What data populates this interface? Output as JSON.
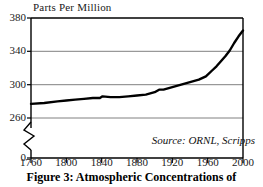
{
  "figure": {
    "caption": "Figure 3: Atmospheric Concentrations of",
    "source_note": "Source: ORNL, Scripps",
    "axis_title": "Parts Per Million"
  },
  "colors": {
    "line": "#000000",
    "grid": "#808080",
    "frame": "#000000",
    "text": "#1a1a1a",
    "background": "#ffffff"
  },
  "chart_data": {
    "type": "line",
    "title": "Parts Per Million",
    "xlabel": "",
    "ylabel": "Parts Per Million",
    "xlim": [
      1760,
      2000
    ],
    "ylim": [
      260,
      380
    ],
    "y_axis_break": true,
    "y_break_labels": [
      "0",
      "260"
    ],
    "grid": true,
    "legend": "none",
    "annotations": [
      "Source: ORNL, Scripps"
    ],
    "xticks": [
      1760,
      1800,
      1840,
      1880,
      1920,
      1960,
      2000
    ],
    "yticks": [
      0,
      260,
      300,
      340,
      380
    ],
    "series": [
      {
        "name": "Atmospheric CO2 concentration",
        "x": [
          1760,
          1775,
          1790,
          1800,
          1810,
          1820,
          1830,
          1838,
          1841,
          1850,
          1860,
          1870,
          1880,
          1890,
          1900,
          1905,
          1910,
          1920,
          1930,
          1940,
          1950,
          1958,
          1965,
          1970,
          1975,
          1980,
          1985,
          1990,
          1995,
          2000
        ],
        "values": [
          277,
          278,
          280,
          281,
          282,
          283,
          284,
          284,
          286,
          285,
          285,
          286,
          287,
          288,
          291,
          294,
          294,
          297,
          300,
          303,
          306,
          310,
          317,
          322,
          328,
          334,
          341,
          350,
          358,
          365
        ]
      }
    ]
  },
  "ytick_labels": [
    {
      "value": 380,
      "label": "380"
    },
    {
      "value": 340,
      "label": "340"
    },
    {
      "value": 300,
      "label": "300"
    },
    {
      "value": 260,
      "label": "260"
    },
    {
      "value": 0,
      "label": "0"
    }
  ],
  "xtick_labels": [
    {
      "value": 1760,
      "label": "1760"
    },
    {
      "value": 1800,
      "label": "1800"
    },
    {
      "value": 1840,
      "label": "1840"
    },
    {
      "value": 1880,
      "label": "1880"
    },
    {
      "value": 1920,
      "label": "1920"
    },
    {
      "value": 1960,
      "label": "1960"
    },
    {
      "value": 2000,
      "label": "2000"
    }
  ]
}
